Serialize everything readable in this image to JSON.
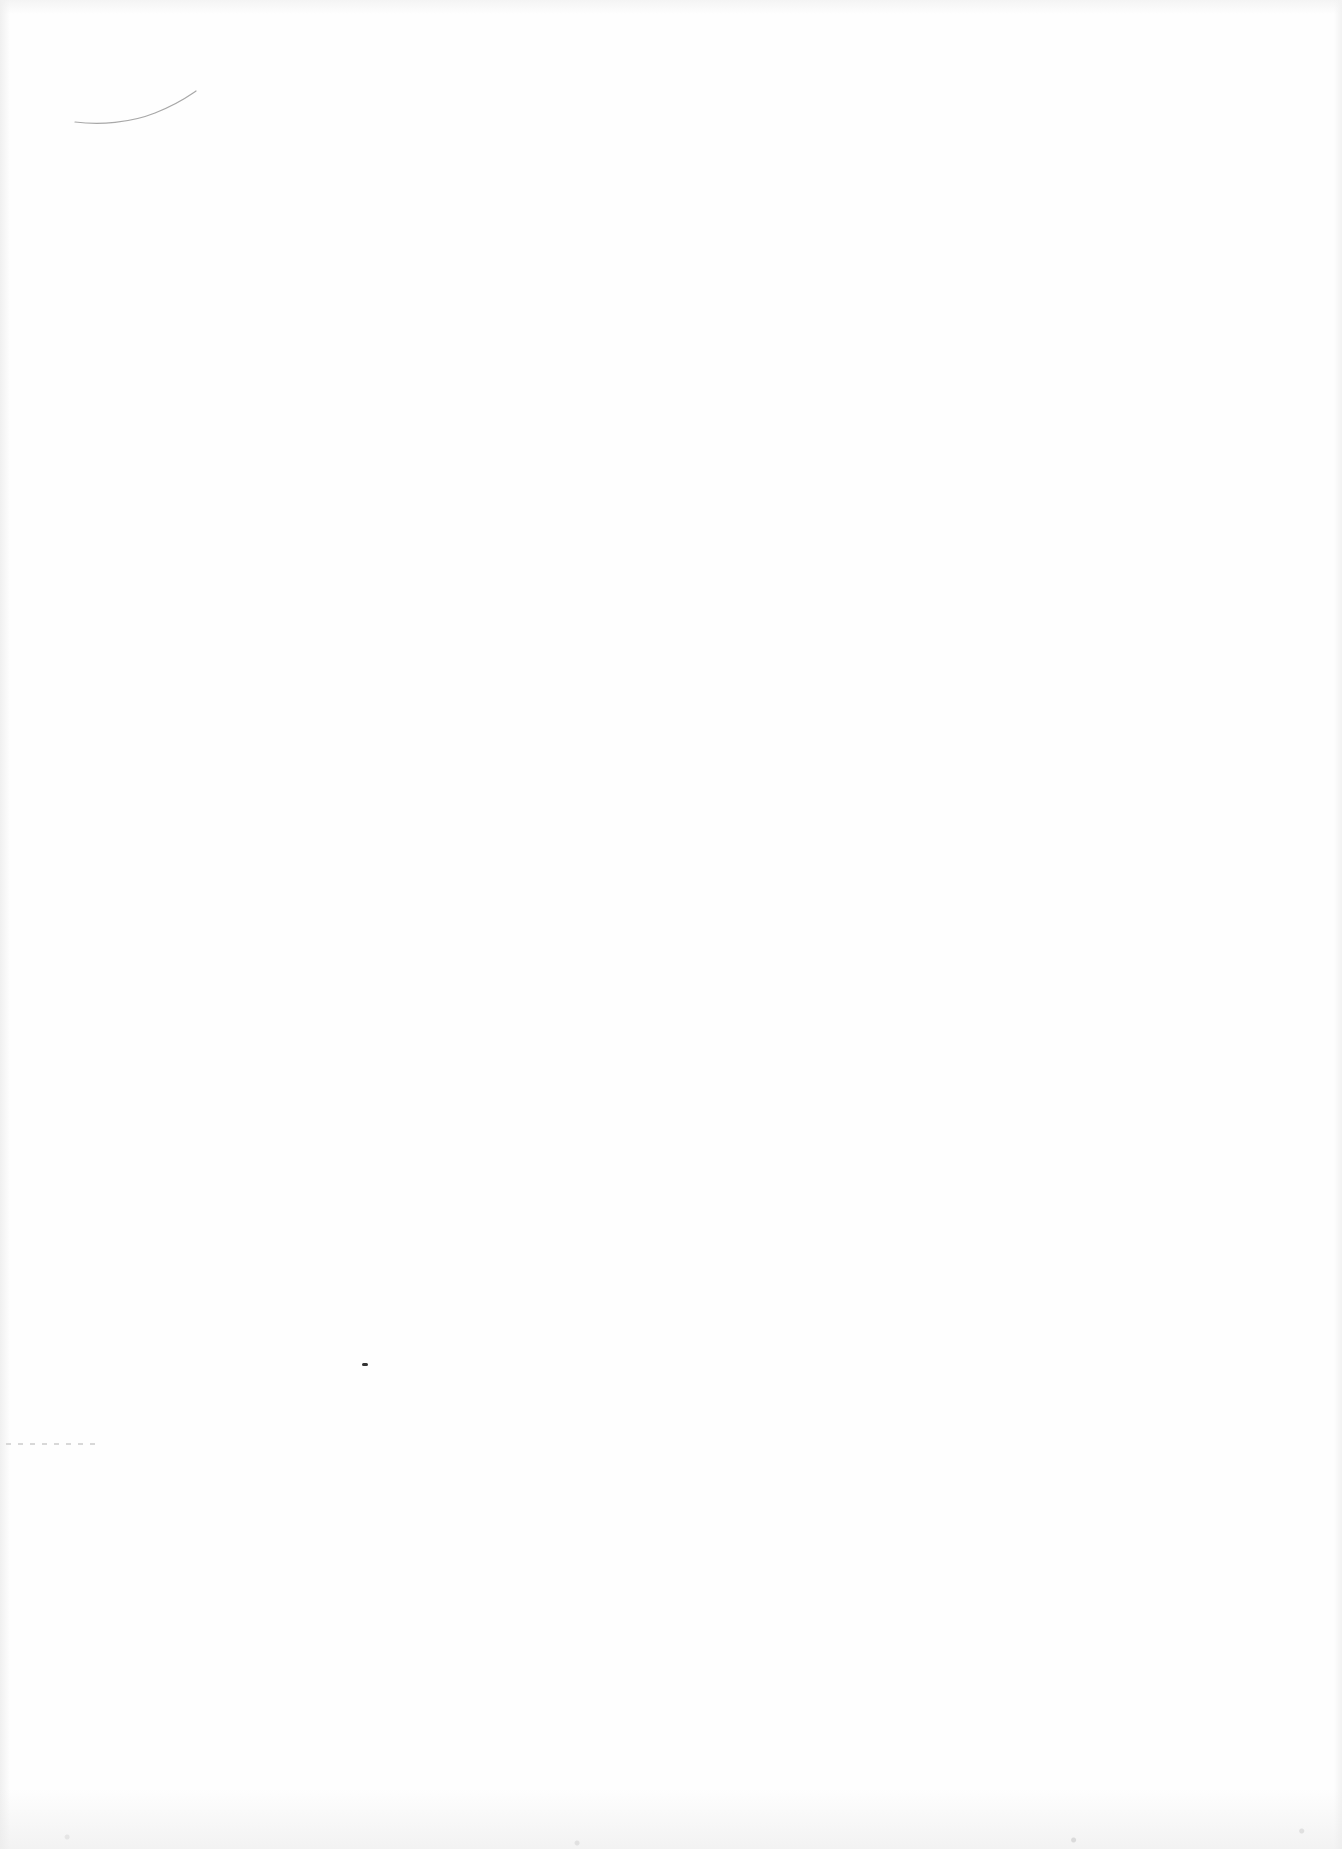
{
  "page": {
    "type": "blank scanned page",
    "background_color": "#fefefe",
    "marks": [
      {
        "kind": "pencil-stroke",
        "description": "faint curved pencil line near top-left"
      },
      {
        "kind": "speck",
        "description": "small dark speck"
      },
      {
        "kind": "scan-noise",
        "description": "grainy noise along page edges"
      }
    ]
  }
}
